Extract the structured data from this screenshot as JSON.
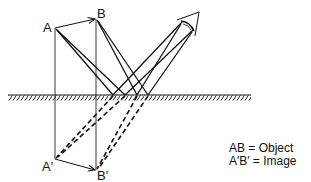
{
  "diagram": {
    "labels": {
      "A": "A",
      "B": "B",
      "A_image": "A′",
      "B_image": "B′"
    },
    "legend": [
      {
        "text": "AB = Object"
      },
      {
        "text": "A′B′ = Image"
      }
    ],
    "elements": {
      "object": "arrow from A to B",
      "image": "arrow from A′ to B′ (virtual, below mirror)",
      "mirror": "horizontal hatched plane mirror",
      "eye": "observer eye at upper right",
      "rays": "solid reflected rays to eye, dashed virtual rays extending behind mirror"
    },
    "colors": {
      "line": "#111111",
      "background": "#ffffff"
    }
  }
}
